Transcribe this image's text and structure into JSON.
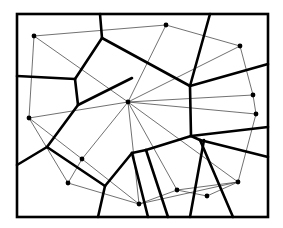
{
  "diagram": {
    "type": "voronoi-delaunay",
    "width": 283,
    "height": 228,
    "colors": {
      "background": "#ffffff",
      "stroke": "#000000",
      "thin": "#333333"
    },
    "frame": {
      "x": 17,
      "y": 14,
      "w": 251,
      "h": 203,
      "stroke_width": 2.6
    },
    "sites": [
      [
        34,
        36
      ],
      [
        166,
        25
      ],
      [
        240,
        46
      ],
      [
        128,
        102
      ],
      [
        29,
        118
      ],
      [
        253,
        95
      ],
      [
        256,
        114
      ],
      [
        82,
        159
      ],
      [
        68,
        183
      ],
      [
        139,
        204
      ],
      [
        177,
        190
      ],
      [
        207,
        196
      ],
      [
        238,
        182
      ]
    ],
    "voronoi_edges": [
      [
        [
          100,
          14
        ],
        [
          102,
          38
        ]
      ],
      [
        [
          102,
          38
        ],
        [
          75,
          79
        ]
      ],
      [
        [
          17,
          76
        ],
        [
          75,
          79
        ]
      ],
      [
        [
          75,
          79
        ],
        [
          78,
          105
        ]
      ],
      [
        [
          102,
          38
        ],
        [
          190,
          86
        ]
      ],
      [
        [
          210,
          14
        ],
        [
          190,
          86
        ]
      ],
      [
        [
          190,
          86
        ],
        [
          268,
          64
        ]
      ],
      [
        [
          190,
          86
        ],
        [
          191,
          136
        ]
      ],
      [
        [
          191,
          136
        ],
        [
          268,
          127
        ]
      ],
      [
        [
          78,
          105
        ],
        [
          47,
          147
        ]
      ],
      [
        [
          47,
          147
        ],
        [
          17,
          165
        ]
      ],
      [
        [
          47,
          147
        ],
        [
          105,
          186
        ]
      ],
      [
        [
          78,
          105
        ],
        [
          132,
          78
        ]
      ],
      [
        [
          105,
          186
        ],
        [
          98,
          217
        ]
      ],
      [
        [
          105,
          186
        ],
        [
          132,
          153
        ]
      ],
      [
        [
          132,
          153
        ],
        [
          146,
          150
        ]
      ],
      [
        [
          146,
          150
        ],
        [
          191,
          136
        ]
      ],
      [
        [
          132,
          153
        ],
        [
          148,
          217
        ]
      ],
      [
        [
          146,
          150
        ],
        [
          168,
          217
        ]
      ],
      [
        [
          191,
          136
        ],
        [
          200,
          140
        ]
      ],
      [
        [
          200,
          140
        ],
        [
          268,
          157
        ]
      ],
      [
        [
          200,
          140
        ],
        [
          233,
          217
        ]
      ],
      [
        [
          204,
          140
        ],
        [
          190,
          217
        ]
      ]
    ],
    "delaunay_edges": [
      [
        0,
        1
      ],
      [
        0,
        3
      ],
      [
        0,
        4
      ],
      [
        1,
        2
      ],
      [
        1,
        3
      ],
      [
        2,
        5
      ],
      [
        2,
        3
      ],
      [
        3,
        5
      ],
      [
        3,
        6
      ],
      [
        5,
        6
      ],
      [
        3,
        4
      ],
      [
        3,
        7
      ],
      [
        3,
        9
      ],
      [
        3,
        10
      ],
      [
        3,
        12
      ],
      [
        4,
        7
      ],
      [
        4,
        8
      ],
      [
        7,
        8
      ],
      [
        7,
        9
      ],
      [
        8,
        9
      ],
      [
        9,
        10
      ],
      [
        9,
        12
      ],
      [
        10,
        11
      ],
      [
        11,
        12
      ],
      [
        6,
        12
      ],
      [
        10,
        12
      ]
    ]
  }
}
